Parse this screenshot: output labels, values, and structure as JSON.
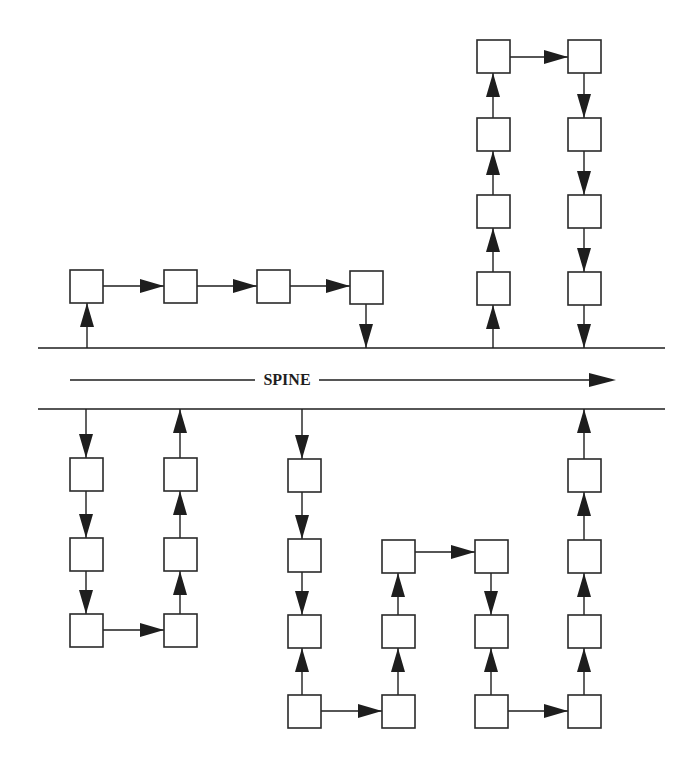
{
  "diagram": {
    "type": "spine-chain-diagram",
    "spine": {
      "label": "SPINE",
      "top_line": {
        "x1": 38,
        "x2": 665,
        "y": 348
      },
      "bottom_line": {
        "x1": 38,
        "x2": 665,
        "y": 409
      },
      "arrow": {
        "x1": 70,
        "x2": 616,
        "y": 380,
        "label_x": 287
      },
      "direction": "right"
    },
    "node_size": {
      "w": 33,
      "h": 33
    },
    "nodes": [
      {
        "id": "A1",
        "x": 70,
        "y": 270
      },
      {
        "id": "A2",
        "x": 164,
        "y": 270
      },
      {
        "id": "A3",
        "x": 257,
        "y": 270
      },
      {
        "id": "A4",
        "x": 350,
        "y": 271
      },
      {
        "id": "B1",
        "x": 477,
        "y": 272
      },
      {
        "id": "B2",
        "x": 477,
        "y": 195
      },
      {
        "id": "B3",
        "x": 477,
        "y": 118
      },
      {
        "id": "B4",
        "x": 477,
        "y": 40
      },
      {
        "id": "B5",
        "x": 568,
        "y": 40
      },
      {
        "id": "B6",
        "x": 568,
        "y": 118
      },
      {
        "id": "B7",
        "x": 568,
        "y": 195
      },
      {
        "id": "B8",
        "x": 568,
        "y": 272
      },
      {
        "id": "C1",
        "x": 70,
        "y": 458
      },
      {
        "id": "C2",
        "x": 70,
        "y": 538
      },
      {
        "id": "C3",
        "x": 70,
        "y": 614
      },
      {
        "id": "C4",
        "x": 164,
        "y": 614
      },
      {
        "id": "C5",
        "x": 164,
        "y": 538
      },
      {
        "id": "C6",
        "x": 164,
        "y": 458
      },
      {
        "id": "D1",
        "x": 288,
        "y": 459
      },
      {
        "id": "D2",
        "x": 288,
        "y": 539
      },
      {
        "id": "D3",
        "x": 288,
        "y": 615
      },
      {
        "id": "D4",
        "x": 288,
        "y": 695
      },
      {
        "id": "D5",
        "x": 382,
        "y": 695
      },
      {
        "id": "D6",
        "x": 382,
        "y": 615
      },
      {
        "id": "D7",
        "x": 382,
        "y": 540
      },
      {
        "id": "D8",
        "x": 475,
        "y": 540
      },
      {
        "id": "D9",
        "x": 475,
        "y": 615
      },
      {
        "id": "D10",
        "x": 475,
        "y": 695
      },
      {
        "id": "D11",
        "x": 568,
        "y": 695
      },
      {
        "id": "D12",
        "x": 568,
        "y": 615
      },
      {
        "id": "D13",
        "x": 568,
        "y": 540
      },
      {
        "id": "D14",
        "x": 568,
        "y": 459
      }
    ],
    "edges": [
      {
        "x1": 87,
        "y1": 348,
        "x2": 87,
        "y2": 303,
        "dir": "up"
      },
      {
        "x1": 103,
        "y1": 286,
        "x2": 164,
        "y2": 286,
        "dir": "right"
      },
      {
        "x1": 196,
        "y1": 286,
        "x2": 257,
        "y2": 286,
        "dir": "right"
      },
      {
        "x1": 290,
        "y1": 286,
        "x2": 350,
        "y2": 286,
        "dir": "right"
      },
      {
        "x1": 366,
        "y1": 304,
        "x2": 366,
        "y2": 348,
        "dir": "down"
      },
      {
        "x1": 493,
        "y1": 348,
        "x2": 493,
        "y2": 305,
        "dir": "up"
      },
      {
        "x1": 493,
        "y1": 272,
        "x2": 493,
        "y2": 228,
        "dir": "up"
      },
      {
        "x1": 493,
        "y1": 195,
        "x2": 493,
        "y2": 151,
        "dir": "up"
      },
      {
        "x1": 493,
        "y1": 118,
        "x2": 493,
        "y2": 73,
        "dir": "up"
      },
      {
        "x1": 506,
        "y1": 57,
        "x2": 568,
        "y2": 57,
        "dir": "right"
      },
      {
        "x1": 584,
        "y1": 73,
        "x2": 584,
        "y2": 118,
        "dir": "down"
      },
      {
        "x1": 584,
        "y1": 151,
        "x2": 584,
        "y2": 195,
        "dir": "down"
      },
      {
        "x1": 584,
        "y1": 228,
        "x2": 584,
        "y2": 272,
        "dir": "down"
      },
      {
        "x1": 584,
        "y1": 305,
        "x2": 584,
        "y2": 348,
        "dir": "down"
      },
      {
        "x1": 86,
        "y1": 409,
        "x2": 86,
        "y2": 458,
        "dir": "down"
      },
      {
        "x1": 86,
        "y1": 491,
        "x2": 86,
        "y2": 538,
        "dir": "down"
      },
      {
        "x1": 86,
        "y1": 571,
        "x2": 86,
        "y2": 614,
        "dir": "down"
      },
      {
        "x1": 103,
        "y1": 630,
        "x2": 164,
        "y2": 630,
        "dir": "right"
      },
      {
        "x1": 180,
        "y1": 614,
        "x2": 180,
        "y2": 571,
        "dir": "up"
      },
      {
        "x1": 180,
        "y1": 538,
        "x2": 180,
        "y2": 491,
        "dir": "up"
      },
      {
        "x1": 180,
        "y1": 458,
        "x2": 180,
        "y2": 409,
        "dir": "up"
      },
      {
        "x1": 302,
        "y1": 409,
        "x2": 302,
        "y2": 459,
        "dir": "down"
      },
      {
        "x1": 302,
        "y1": 492,
        "x2": 302,
        "y2": 539,
        "dir": "down"
      },
      {
        "x1": 302,
        "y1": 568,
        "x2": 302,
        "y2": 615,
        "dir": "down"
      },
      {
        "x1": 302,
        "y1": 695,
        "x2": 302,
        "y2": 648,
        "dir": "up"
      },
      {
        "x1": 321,
        "y1": 711,
        "x2": 382,
        "y2": 711,
        "dir": "right"
      },
      {
        "x1": 398,
        "y1": 695,
        "x2": 398,
        "y2": 648,
        "dir": "up"
      },
      {
        "x1": 398,
        "y1": 615,
        "x2": 398,
        "y2": 573,
        "dir": "up"
      },
      {
        "x1": 412,
        "y1": 552,
        "x2": 475,
        "y2": 552,
        "dir": "right"
      },
      {
        "x1": 491,
        "y1": 568,
        "x2": 491,
        "y2": 615,
        "dir": "down"
      },
      {
        "x1": 491,
        "y1": 695,
        "x2": 491,
        "y2": 648,
        "dir": "up"
      },
      {
        "x1": 505,
        "y1": 711,
        "x2": 568,
        "y2": 711,
        "dir": "right"
      },
      {
        "x1": 584,
        "y1": 695,
        "x2": 584,
        "y2": 648,
        "dir": "up"
      },
      {
        "x1": 584,
        "y1": 615,
        "x2": 584,
        "y2": 573,
        "dir": "up"
      },
      {
        "x1": 584,
        "y1": 540,
        "x2": 584,
        "y2": 492,
        "dir": "up"
      },
      {
        "x1": 584,
        "y1": 459,
        "x2": 584,
        "y2": 409,
        "dir": "up"
      }
    ]
  }
}
